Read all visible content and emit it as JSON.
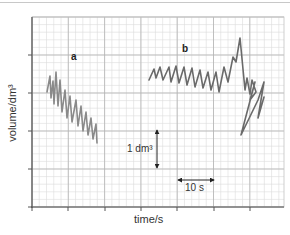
{
  "chart_data": {
    "type": "line",
    "title": "",
    "xlabel": "time/s",
    "ylabel": "volume/dm³",
    "grid": true,
    "legend": null,
    "plot_area_px": {
      "left": 32,
      "top": 17,
      "right": 284,
      "bottom": 207
    },
    "x_major_px": 36.3,
    "y_major_px": 38,
    "x_tick_px": [
      32,
      68,
      105,
      141,
      177,
      214,
      250
    ],
    "y_tick_px": [
      55,
      93,
      131,
      169,
      207
    ],
    "x_tick_labels": [],
    "y_tick_labels": [],
    "scale_bars": {
      "volume": {
        "label": "1 dm³",
        "value": 1,
        "unit": "dm³",
        "x_px": 157,
        "y1_px": 130,
        "y2_px": 168
      },
      "time": {
        "label": "10 s",
        "value": 10,
        "unit": "s",
        "y_px": 180,
        "x1_px": 178,
        "x2_px": 214
      }
    },
    "annotations": [
      {
        "text": "a",
        "x_px": 74,
        "y_px": 58
      },
      {
        "text": "b",
        "x_px": 185,
        "y_px": 50
      }
    ],
    "series": [
      {
        "name": "a",
        "description": "rapid shallow breathing trace with declining baseline",
        "color": "#8a8a8a",
        "points_px": [
          [
            47,
            92
          ],
          [
            50,
            76
          ],
          [
            51,
            98
          ],
          [
            53,
            81
          ],
          [
            54,
            104
          ],
          [
            56,
            72
          ],
          [
            58,
            106
          ],
          [
            60,
            80
          ],
          [
            62,
            112
          ],
          [
            65,
            90
          ],
          [
            67,
            118
          ],
          [
            70,
            96
          ],
          [
            72,
            122
          ],
          [
            76,
            100
          ],
          [
            78,
            126
          ],
          [
            81,
            106
          ],
          [
            83,
            131
          ],
          [
            86,
            112
          ],
          [
            88,
            135
          ],
          [
            91,
            118
          ],
          [
            93,
            139
          ],
          [
            96,
            124
          ],
          [
            97,
            143
          ]
        ]
      },
      {
        "name": "b",
        "description": "regular tidal breathing followed by deep breaths",
        "color": "#6a6a6a",
        "points_px": [
          [
            149,
            80
          ],
          [
            154,
            69
          ],
          [
            156,
            78
          ],
          [
            160,
            67
          ],
          [
            163,
            80
          ],
          [
            169,
            67
          ],
          [
            171,
            82
          ],
          [
            176,
            66
          ],
          [
            179,
            83
          ],
          [
            184,
            67
          ],
          [
            187,
            85
          ],
          [
            192,
            68
          ],
          [
            195,
            87
          ],
          [
            200,
            70
          ],
          [
            203,
            88
          ],
          [
            208,
            72
          ],
          [
            211,
            90
          ],
          [
            216,
            72
          ],
          [
            219,
            92
          ],
          [
            224,
            67
          ],
          [
            228,
            82
          ],
          [
            233,
            57
          ],
          [
            236,
            62
          ],
          [
            240,
            38
          ],
          [
            245,
            90
          ],
          [
            247,
            78
          ],
          [
            250,
            94
          ],
          [
            252,
            80
          ],
          [
            256,
            92
          ],
          [
            250,
            100
          ],
          [
            255,
            82
          ],
          [
            241,
            135
          ],
          [
            258,
            100
          ],
          [
            260,
            94
          ],
          [
            264,
            82
          ],
          [
            258,
            118
          ],
          [
            264,
            97
          ]
        ]
      }
    ]
  }
}
